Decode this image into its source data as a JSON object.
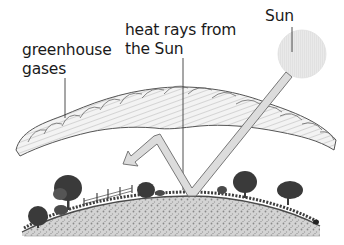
{
  "diagram": {
    "labels": {
      "greenhouse_line1": "greenhouse",
      "greenhouse_line2": "gases",
      "heat_line1": "heat rays from",
      "heat_line2": "the Sun",
      "sun": "Sun"
    },
    "elements": [
      {
        "name": "sun",
        "description": "pale gray circle, upper right"
      },
      {
        "name": "greenhouse-gas-layer",
        "description": "cloud-like band arching over the Earth"
      },
      {
        "name": "heat-ray-arrow",
        "description": "arrow from Sun to ground, reflecting up to gas layer, then back down-left"
      },
      {
        "name": "earth-surface",
        "description": "curved hill with trees and a fence"
      }
    ],
    "colors": {
      "sun_fill": "#e8e8e8",
      "arrow_fill": "#dcdcdc",
      "arrow_stroke": "#6a6a6a",
      "cloud_fill": "#f2f2f2",
      "cloud_stroke": "#555555",
      "ground_fill": "#cfcfcf",
      "tree_fill": "#3a3a3a",
      "text": "#1a1a1a"
    }
  }
}
